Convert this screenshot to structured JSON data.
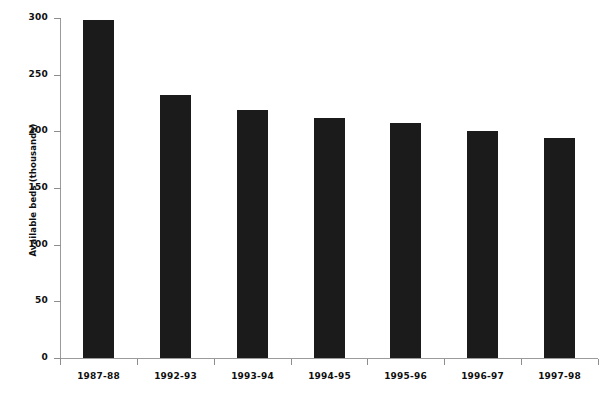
{
  "chart_data": {
    "type": "bar",
    "title": "",
    "xlabel": "",
    "ylabel": "Available beds (thousands)",
    "categories": [
      "1987-88",
      "1992-93",
      "1993-94",
      "1994-95",
      "1995-96",
      "1996-97",
      "1997-98"
    ],
    "values": [
      298,
      232,
      219,
      212,
      207,
      200,
      194
    ],
    "ylim": [
      0,
      300
    ],
    "ytick_labels": [
      "0",
      "50",
      "100",
      "150",
      "200",
      "250",
      "300"
    ],
    "ytick_values": [
      0,
      50,
      100,
      150,
      200,
      250,
      300
    ],
    "grid": false,
    "legend": "none",
    "series": [
      {
        "name": "Available beds",
        "values": [
          298,
          232,
          219,
          212,
          207,
          200,
          194
        ]
      }
    ],
    "bar_color": "#1b1b1b",
    "axis_color": "#9b9b9b",
    "background_color": "#ffffff"
  },
  "figure": {
    "caption_strip": ""
  }
}
